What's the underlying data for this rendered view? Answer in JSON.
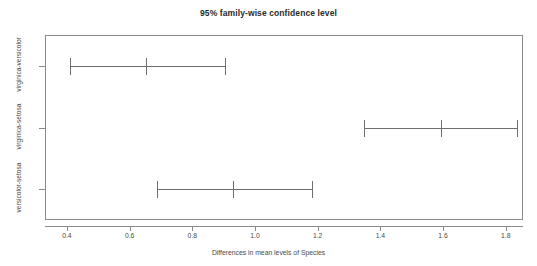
{
  "chart_data": {
    "type": "bar",
    "title": "95% family-wise confidence level",
    "xlabel": "Differences in mean levels of Species",
    "ylabel": "",
    "subtitle": "",
    "grid": false,
    "legend": "none",
    "xlim": [
      0.33,
      1.855
    ],
    "xticks": [
      "0.4",
      "0.6",
      "0.8",
      "1.0",
      "1.2",
      "1.4",
      "1.6",
      "1.8"
    ],
    "xtick_values": [
      0.4,
      0.6,
      0.8,
      1.0,
      1.2,
      1.4,
      1.6,
      1.8
    ],
    "categories": [
      "virginica-versicolor",
      "virginica-setosa",
      "versicolor-setosa"
    ],
    "series": [
      {
        "name": "difference in means",
        "values": [
          0.652,
          1.594,
          0.93
        ]
      },
      {
        "name": "lower confidence limit",
        "values": [
          0.41,
          1.349,
          0.686
        ]
      },
      {
        "name": "upper confidence limit",
        "values": [
          0.904,
          1.837,
          1.181
        ]
      }
    ],
    "intervals": [
      {
        "category": "virginica-versicolor",
        "lower": 0.41,
        "center": 0.652,
        "upper": 0.904
      },
      {
        "category": "virginica-setosa",
        "lower": 1.349,
        "center": 1.594,
        "upper": 1.837
      },
      {
        "category": "versicolor-setosa",
        "lower": 0.686,
        "center": 0.93,
        "upper": 1.181
      }
    ]
  }
}
